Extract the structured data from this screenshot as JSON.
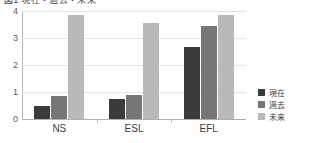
{
  "title": {
    "text": "図1  現在・過去・未来",
    "visible_note": "cropped at top edge"
  },
  "chart_data": {
    "type": "bar",
    "title": "図1  現在・過去・未来",
    "xlabel": "",
    "ylabel": "",
    "categories": [
      "NS",
      "ESL",
      "EFL"
    ],
    "series": [
      {
        "name": "現在",
        "color": "#3b3b3b",
        "values": [
          0.5,
          0.75,
          2.65
        ]
      },
      {
        "name": "過去",
        "color": "#767676",
        "values": [
          0.85,
          0.9,
          3.45
        ]
      },
      {
        "name": "未来",
        "color": "#b9b9b9",
        "values": [
          3.85,
          3.55,
          3.85
        ]
      }
    ],
    "ylim": [
      0,
      4
    ],
    "yticks": [
      0,
      1,
      2,
      3,
      4
    ],
    "ytick_labels": [
      "0",
      "1",
      "2",
      "3",
      "4"
    ],
    "grid": true,
    "legend_position": "right"
  },
  "axis": {
    "y_labels": [
      "4",
      "3",
      "2",
      "1",
      "0"
    ]
  },
  "legend": {
    "items": [
      {
        "label": "現在"
      },
      {
        "label": "過去"
      },
      {
        "label": "未来"
      }
    ]
  }
}
